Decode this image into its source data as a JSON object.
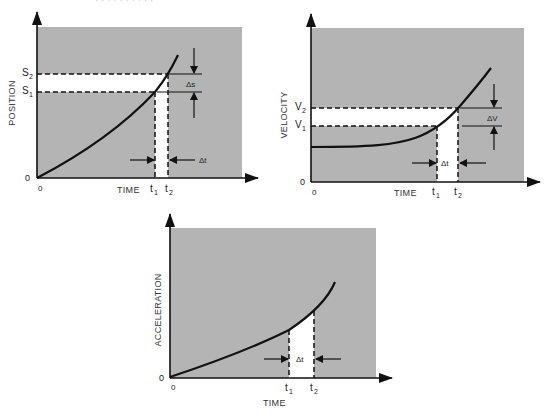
{
  "page": {
    "top_cut_text": "· · ·   ·            ·  ·   · ·   ·  ·"
  },
  "colors": {
    "panel_fill": "#b4b4b4",
    "band_fill": "#ffffff",
    "line": "#111111"
  },
  "panels": {
    "position": {
      "ylabel": "POSITION",
      "xlabel": "TIME",
      "origin_y": "0",
      "origin_x": "0",
      "y_marks": [
        {
          "base": "S",
          "sub": "2"
        },
        {
          "base": "S",
          "sub": "1"
        }
      ],
      "x_marks": [
        {
          "base": "t",
          "sub": "1"
        },
        {
          "base": "t",
          "sub": "2"
        }
      ],
      "delta_y": "Δs",
      "delta_x": "Δt"
    },
    "velocity": {
      "ylabel": "VELOCITY",
      "xlabel": "TIME",
      "origin_y": "0",
      "origin_x": "0",
      "y_marks": [
        {
          "base": "V",
          "sub": "2"
        },
        {
          "base": "V",
          "sub": "1"
        }
      ],
      "x_marks": [
        {
          "base": "t",
          "sub": "1"
        },
        {
          "base": "t",
          "sub": "2"
        }
      ],
      "delta_y": "ΔV",
      "delta_x": "Δt"
    },
    "acceleration": {
      "ylabel": "ACCELERATION",
      "xlabel": "TIME",
      "origin_y": "0",
      "origin_x": "0",
      "x_marks": [
        {
          "base": "t",
          "sub": "1"
        },
        {
          "base": "t",
          "sub": "2"
        }
      ],
      "delta_x": "Δt"
    }
  }
}
